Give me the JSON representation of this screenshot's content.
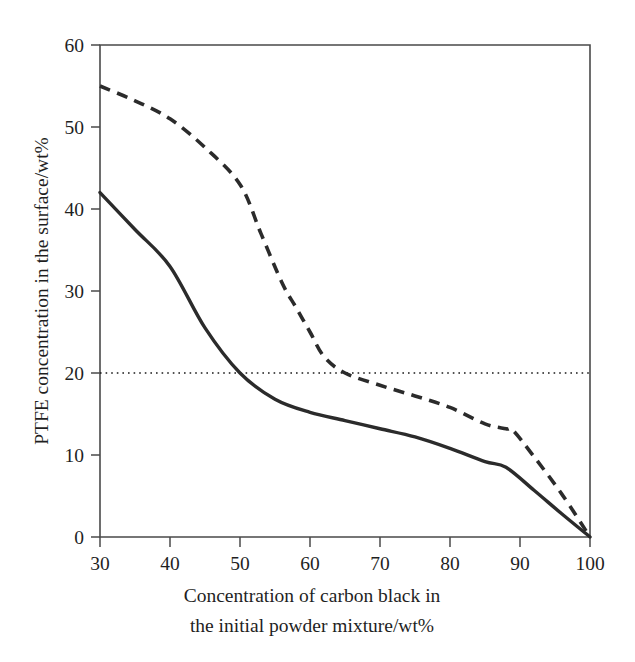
{
  "chart_data": {
    "type": "line",
    "title": "",
    "xlabel": "Concentration of carbon black in the initial powder mixture/wt%",
    "xlabel_line1": "Concentration of carbon black in",
    "xlabel_line2": "the initial powder mixture/wt%",
    "ylabel": "PTFE concentration in the surface/wt%",
    "xlim": [
      30,
      100
    ],
    "ylim": [
      0,
      60
    ],
    "xticks": [
      30,
      40,
      50,
      60,
      70,
      80,
      90,
      100
    ],
    "xtick_labels": [
      "30",
      "40",
      "50",
      "60",
      "70",
      "80",
      "90",
      "100"
    ],
    "yticks": [
      0,
      10,
      20,
      30,
      40,
      50,
      60
    ],
    "ytick_labels": [
      "0",
      "10",
      "20",
      "30",
      "40",
      "50",
      "60"
    ],
    "grid": false,
    "legend": null,
    "annotations": [
      {
        "name": "threshold-reference-line",
        "type": "horizontal-dotted-line",
        "y": 20,
        "label": ""
      }
    ],
    "series": [
      {
        "name": "solid-curve",
        "style": "solid",
        "color": "#2b2b2b",
        "x": [
          30,
          35,
          40,
          45,
          50,
          55,
          60,
          65,
          70,
          75,
          80,
          85,
          88,
          92,
          96,
          100
        ],
        "values": [
          42,
          37.5,
          33,
          25.5,
          20,
          16.8,
          15.2,
          14.2,
          13.2,
          12.2,
          10.8,
          9.2,
          8.5,
          5.7,
          2.8,
          0
        ]
      },
      {
        "name": "dashed-curve",
        "style": "dashed",
        "color": "#2b2b2b",
        "x": [
          30,
          35,
          40,
          45,
          50,
          53,
          56,
          58,
          60,
          62,
          65,
          70,
          75,
          80,
          85,
          88,
          89,
          92,
          96,
          100
        ],
        "values": [
          55,
          53.2,
          51,
          47.5,
          43,
          37,
          31,
          28,
          25,
          22,
          20,
          18.5,
          17.2,
          15.8,
          13.8,
          13.2,
          13,
          9.8,
          5.2,
          0
        ]
      }
    ]
  },
  "axes": {
    "y_axis_title": "PTFE concentration in the surface/wt%",
    "x_axis_title_line1": "Concentration of carbon black in",
    "x_axis_title_line2": "the initial powder mixture/wt%"
  },
  "x_tick_labels": {
    "t0": "30",
    "t1": "40",
    "t2": "50",
    "t3": "60",
    "t4": "70",
    "t5": "80",
    "t6": "90",
    "t7": "100"
  },
  "y_tick_labels": {
    "t0": "0",
    "t1": "10",
    "t2": "20",
    "t3": "30",
    "t4": "40",
    "t5": "50",
    "t6": "60"
  },
  "colors": {
    "curve": "#2b2b2b",
    "frame": "#4a4a4a",
    "text": "#1f1f1f",
    "background": "#ffffff"
  }
}
